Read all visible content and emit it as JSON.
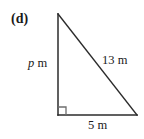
{
  "figure": {
    "part_label": "(d)",
    "shape": "right-triangle",
    "stroke_color": "#2b2b2b",
    "background_color": "#ffffff",
    "vertices": {
      "apex": [
        58,
        14
      ],
      "right_angle": [
        58,
        115
      ],
      "base_end": [
        137,
        115
      ]
    },
    "right_angle_marker": {
      "shown": true,
      "size": 8
    },
    "labels": {
      "vertical_leg_variable": "p",
      "vertical_leg_unit": "m",
      "vertical_leg": "p m",
      "hypotenuse": "13 m",
      "base": "5 m"
    }
  }
}
